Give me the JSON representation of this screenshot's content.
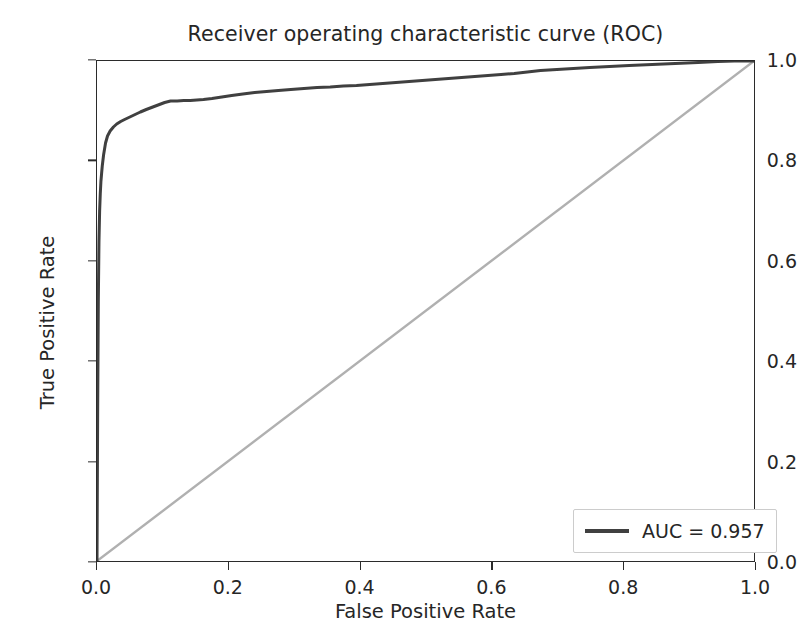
{
  "chart_data": {
    "type": "line",
    "title": "Receiver operating characteristic curve (ROC)",
    "xlabel": "False Positive Rate",
    "ylabel": "True Positive Rate",
    "xlim": [
      0.0,
      1.0
    ],
    "ylim": [
      0.0,
      1.0
    ],
    "grid": false,
    "legend_position": "lower right",
    "xticks": [
      "0.0",
      "0.2",
      "0.4",
      "0.6",
      "0.8",
      "1.0"
    ],
    "xtick_values": [
      0.0,
      0.2,
      0.4,
      0.6,
      0.8,
      1.0
    ],
    "yticks": [
      "0.0",
      "0.2",
      "0.4",
      "0.6",
      "0.8",
      "1.0"
    ],
    "ytick_values": [
      0.0,
      0.2,
      0.4,
      0.6,
      0.8,
      1.0
    ],
    "auc": 0.957,
    "series": [
      {
        "name": "AUC = 0.957",
        "color": "#404040",
        "linewidth": 3.0,
        "x": [
          0.0,
          0.001,
          0.002,
          0.003,
          0.004,
          0.005,
          0.006,
          0.007,
          0.008,
          0.01,
          0.013,
          0.016,
          0.02,
          0.025,
          0.03,
          0.036,
          0.042,
          0.05,
          0.058,
          0.066,
          0.075,
          0.085,
          0.095,
          0.103,
          0.112,
          0.122,
          0.132,
          0.142,
          0.152,
          0.162,
          0.175,
          0.19,
          0.205,
          0.222,
          0.24,
          0.258,
          0.276,
          0.295,
          0.315,
          0.335,
          0.355,
          0.375,
          0.395,
          0.415,
          0.435,
          0.455,
          0.475,
          0.495,
          0.515,
          0.535,
          0.555,
          0.575,
          0.595,
          0.615,
          0.635,
          0.655,
          0.675,
          0.7,
          0.725,
          0.75,
          0.78,
          0.81,
          0.845,
          0.88,
          0.915,
          0.945,
          0.97,
          1.0
        ],
        "y": [
          0.0,
          0.3,
          0.52,
          0.64,
          0.7,
          0.735,
          0.76,
          0.775,
          0.79,
          0.812,
          0.836,
          0.85,
          0.86,
          0.868,
          0.874,
          0.879,
          0.883,
          0.888,
          0.893,
          0.898,
          0.903,
          0.908,
          0.913,
          0.917,
          0.92,
          0.92,
          0.921,
          0.921,
          0.922,
          0.923,
          0.925,
          0.928,
          0.931,
          0.934,
          0.937,
          0.939,
          0.941,
          0.943,
          0.945,
          0.947,
          0.948,
          0.95,
          0.951,
          0.953,
          0.955,
          0.957,
          0.959,
          0.961,
          0.963,
          0.965,
          0.967,
          0.969,
          0.971,
          0.973,
          0.975,
          0.978,
          0.981,
          0.983,
          0.985,
          0.987,
          0.989,
          0.991,
          0.993,
          0.995,
          0.997,
          0.999,
          1.0,
          1.0
        ]
      },
      {
        "name": "chance-diagonal",
        "color": "#b0b0b0",
        "linewidth": 2.4,
        "x": [
          0.0,
          1.0
        ],
        "y": [
          0.0,
          1.0
        ]
      }
    ],
    "legend_entries": [
      {
        "label": "AUC = 0.957",
        "color": "#404040"
      }
    ]
  }
}
